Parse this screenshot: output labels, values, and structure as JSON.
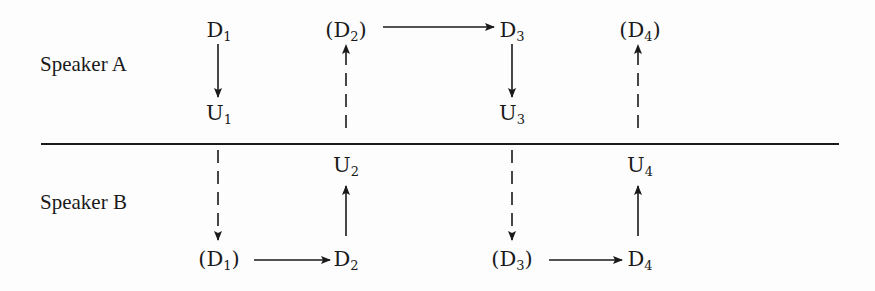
{
  "diagram": {
    "divider": {
      "x1": 41,
      "x2": 839,
      "y": 144
    },
    "speakers": [
      {
        "id": "A",
        "label": "Speaker A",
        "x": 40,
        "y": 52
      },
      {
        "id": "B",
        "label": "Speaker B",
        "x": 40,
        "y": 190
      }
    ],
    "nodes": [
      {
        "id": "A_D1",
        "base": "D",
        "sub": "1",
        "parenthesized": false,
        "x": 219,
        "y": 18
      },
      {
        "id": "A_U1",
        "base": "U",
        "sub": "1",
        "parenthesized": false,
        "x": 219,
        "y": 101
      },
      {
        "id": "A_D2",
        "base": "D",
        "sub": "2",
        "parenthesized": true,
        "x": 346,
        "y": 18
      },
      {
        "id": "B_U2",
        "base": "U",
        "sub": "2",
        "parenthesized": false,
        "x": 346,
        "y": 153
      },
      {
        "id": "A_D3",
        "base": "D",
        "sub": "3",
        "parenthesized": false,
        "x": 512,
        "y": 18
      },
      {
        "id": "A_U3",
        "base": "U",
        "sub": "3",
        "parenthesized": false,
        "x": 512,
        "y": 101
      },
      {
        "id": "A_D4",
        "base": "D",
        "sub": "4",
        "parenthesized": true,
        "x": 640,
        "y": 18
      },
      {
        "id": "B_U4",
        "base": "U",
        "sub": "4",
        "parenthesized": false,
        "x": 640,
        "y": 153
      },
      {
        "id": "B_D1",
        "base": "D",
        "sub": "1",
        "parenthesized": true,
        "x": 219,
        "y": 247
      },
      {
        "id": "B_D2",
        "base": "D",
        "sub": "2",
        "parenthesized": false,
        "x": 346,
        "y": 247
      },
      {
        "id": "B_D3",
        "base": "D",
        "sub": "3",
        "parenthesized": true,
        "x": 512,
        "y": 247
      },
      {
        "id": "B_D4",
        "base": "D",
        "sub": "4",
        "parenthesized": false,
        "x": 640,
        "y": 247
      }
    ],
    "edges": [
      {
        "from": "A_D1",
        "to": "A_U1",
        "style": "solid",
        "x1": 218,
        "y1": 44,
        "x2": 218,
        "y2": 97
      },
      {
        "from": "A_U1",
        "to": "B_D1",
        "style": "dashed",
        "x1": 218,
        "y1": 150,
        "x2": 218,
        "y2": 240
      },
      {
        "from": "B_D1",
        "to": "B_D2",
        "style": "solid",
        "x1": 254,
        "y1": 260,
        "x2": 330,
        "y2": 260
      },
      {
        "from": "B_D2",
        "to": "B_U2",
        "style": "solid",
        "x1": 346,
        "y1": 236,
        "x2": 346,
        "y2": 186
      },
      {
        "from": "B_U2",
        "to": "A_D2",
        "style": "dashed",
        "x1": 346,
        "y1": 128,
        "x2": 346,
        "y2": 45
      },
      {
        "from": "A_D2",
        "to": "A_D3",
        "style": "solid",
        "x1": 383,
        "y1": 27,
        "x2": 494,
        "y2": 27
      },
      {
        "from": "A_D3",
        "to": "A_U3",
        "style": "solid",
        "x1": 512,
        "y1": 44,
        "x2": 512,
        "y2": 97
      },
      {
        "from": "A_U3",
        "to": "B_D3",
        "style": "dashed",
        "x1": 512,
        "y1": 150,
        "x2": 512,
        "y2": 240
      },
      {
        "from": "B_D3",
        "to": "B_D4",
        "style": "solid",
        "x1": 549,
        "y1": 260,
        "x2": 622,
        "y2": 260
      },
      {
        "from": "B_D4",
        "to": "B_U4",
        "style": "solid",
        "x1": 638,
        "y1": 236,
        "x2": 638,
        "y2": 186
      },
      {
        "from": "B_U4",
        "to": "A_D4",
        "style": "dashed",
        "x1": 638,
        "y1": 128,
        "x2": 638,
        "y2": 45
      }
    ],
    "colors": {
      "ink": "#1a1a1a",
      "background": "#fdfdfd"
    }
  }
}
